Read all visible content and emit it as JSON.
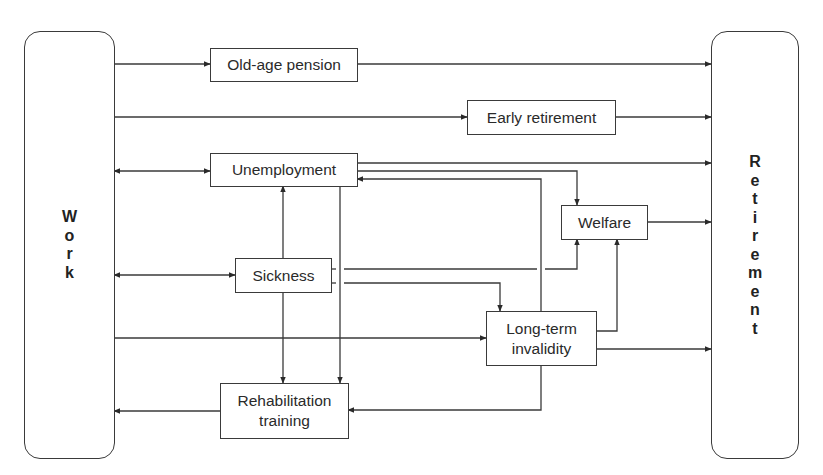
{
  "diagram": {
    "type": "flow",
    "colors": {
      "line": "#3a3a3a",
      "text": "#2a2a2a",
      "background": "#ffffff"
    },
    "pillars": {
      "work": {
        "label": "Work",
        "letters": [
          "W",
          "o",
          "r",
          "k"
        ]
      },
      "retirement": {
        "label": "Retirement",
        "letters": [
          "R",
          "e",
          "t",
          "i",
          "r",
          "e",
          "m",
          "e",
          "n",
          "t"
        ]
      }
    },
    "nodes": {
      "old_age_pension": "Old-age pension",
      "early_retirement": "Early retirement",
      "unemployment": "Unemployment",
      "welfare": "Welfare",
      "sickness": "Sickness",
      "long_term_invalidity": "Long-term\ninvalidity",
      "rehabilitation_training": "Rehabilitation\ntraining"
    },
    "edges": [
      {
        "from": "Work",
        "to": "Old-age pension"
      },
      {
        "from": "Old-age pension",
        "to": "Retirement"
      },
      {
        "from": "Work",
        "to": "Early retirement"
      },
      {
        "from": "Early retirement",
        "to": "Retirement"
      },
      {
        "from": "Work",
        "to": "Unemployment",
        "bidirectional": true
      },
      {
        "from": "Unemployment",
        "to": "Retirement"
      },
      {
        "from": "Unemployment",
        "to": "Welfare"
      },
      {
        "from": "Unemployment",
        "to": "Rehabilitation training"
      },
      {
        "from": "Long-term invalidity",
        "to": "Unemployment"
      },
      {
        "from": "Welfare",
        "to": "Retirement"
      },
      {
        "from": "Work",
        "to": "Sickness",
        "bidirectional": true
      },
      {
        "from": "Sickness",
        "to": "Unemployment"
      },
      {
        "from": "Sickness",
        "to": "Welfare"
      },
      {
        "from": "Sickness",
        "to": "Long-term invalidity"
      },
      {
        "from": "Sickness",
        "to": "Rehabilitation training"
      },
      {
        "from": "Work",
        "to": "Long-term invalidity"
      },
      {
        "from": "Long-term invalidity",
        "to": "Welfare"
      },
      {
        "from": "Long-term invalidity",
        "to": "Retirement"
      },
      {
        "from": "Long-term invalidity",
        "to": "Rehabilitation training"
      },
      {
        "from": "Rehabilitation training",
        "to": "Work"
      }
    ]
  }
}
